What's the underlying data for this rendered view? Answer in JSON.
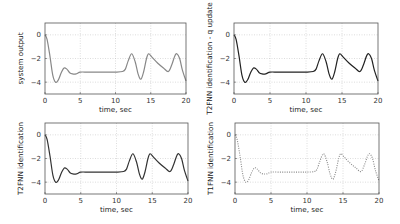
{
  "chart_data": [
    {
      "type": "line",
      "title": "",
      "xlabel": "time, sec",
      "ylabel": "system output",
      "xlim": [
        0,
        20
      ],
      "ylim": [
        -5,
        1
      ],
      "xticks": [
        0,
        5,
        10,
        15,
        20
      ],
      "yticks": [
        0,
        -2,
        -4
      ],
      "grid": true,
      "series": [
        {
          "name": "system output",
          "color": "#888888",
          "style": "solid",
          "x": [
            0,
            0.3,
            0.7,
            1.1,
            1.5,
            1.9,
            2.3,
            2.7,
            3.1,
            3.5,
            3.9,
            4.4,
            5,
            6,
            7,
            8,
            9,
            10,
            11,
            11.4,
            11.8,
            12.3,
            12.8,
            13.2,
            13.6,
            14.0,
            14.4,
            14.7,
            15.2,
            16,
            16.8,
            17.5,
            18.0,
            18.4,
            18.7,
            19.1,
            19.5,
            20
          ],
          "values": [
            0,
            -0.4,
            -1.8,
            -3.4,
            -4.0,
            -3.8,
            -3.2,
            -2.8,
            -2.9,
            -3.2,
            -3.3,
            -3.3,
            -3.15,
            -3.15,
            -3.15,
            -3.15,
            -3.15,
            -3.15,
            -3.1,
            -2.9,
            -2.2,
            -1.6,
            -2.3,
            -3.3,
            -3.75,
            -3.1,
            -2.0,
            -1.6,
            -1.9,
            -2.4,
            -2.8,
            -3.1,
            -2.5,
            -1.8,
            -1.6,
            -2.0,
            -3.0,
            -3.9
          ]
        }
      ]
    },
    {
      "type": "line",
      "title": "",
      "xlabel": "time, sec",
      "ylabel": "T2FNN identification - q update",
      "xlim": [
        0,
        20
      ],
      "ylim": [
        -5,
        1
      ],
      "xticks": [
        0,
        5,
        10,
        15,
        20
      ],
      "yticks": [
        0,
        -2,
        -4
      ],
      "grid": true,
      "series": [
        {
          "name": "T2FNN identification - q update",
          "color": "#222222",
          "style": "solid",
          "x": [
            0,
            0.3,
            0.7,
            1.1,
            1.5,
            1.9,
            2.3,
            2.7,
            3.1,
            3.5,
            3.9,
            4.4,
            5,
            6,
            7,
            8,
            9,
            10,
            11,
            11.4,
            11.8,
            12.3,
            12.8,
            13.2,
            13.6,
            14.0,
            14.4,
            14.7,
            15.2,
            16,
            16.8,
            17.5,
            18.0,
            18.4,
            18.7,
            19.1,
            19.5,
            20
          ],
          "values": [
            0,
            -0.4,
            -1.8,
            -3.4,
            -4.0,
            -3.8,
            -3.2,
            -2.8,
            -2.9,
            -3.2,
            -3.3,
            -3.3,
            -3.15,
            -3.15,
            -3.15,
            -3.15,
            -3.15,
            -3.15,
            -3.1,
            -2.9,
            -2.2,
            -1.6,
            -2.3,
            -3.3,
            -3.75,
            -3.1,
            -2.0,
            -1.6,
            -1.9,
            -2.4,
            -2.8,
            -3.1,
            -2.5,
            -1.8,
            -1.6,
            -2.0,
            -3.0,
            -3.9
          ]
        }
      ]
    },
    {
      "type": "line",
      "title": "",
      "xlabel": "time, sec",
      "ylabel": "T2FNN identification",
      "xlim": [
        0,
        20
      ],
      "ylim": [
        -5,
        1
      ],
      "xticks": [
        0,
        5,
        10,
        15,
        20
      ],
      "yticks": [
        0,
        -2,
        -4
      ],
      "grid": true,
      "series": [
        {
          "name": "T2FNN identification",
          "color": "#333333",
          "style": "solid",
          "x": [
            0,
            0.3,
            0.7,
            1.1,
            1.5,
            1.9,
            2.3,
            2.7,
            3.1,
            3.5,
            3.9,
            4.4,
            5,
            6,
            7,
            8,
            9,
            10,
            11,
            11.4,
            11.8,
            12.3,
            12.8,
            13.2,
            13.6,
            14.0,
            14.4,
            14.7,
            15.2,
            16,
            16.8,
            17.5,
            18.0,
            18.4,
            18.7,
            19.1,
            19.5,
            20
          ],
          "values": [
            0,
            -0.4,
            -1.8,
            -3.4,
            -4.0,
            -3.8,
            -3.2,
            -2.8,
            -2.9,
            -3.2,
            -3.3,
            -3.3,
            -3.15,
            -3.15,
            -3.15,
            -3.15,
            -3.15,
            -3.15,
            -3.1,
            -2.9,
            -2.2,
            -1.6,
            -2.3,
            -3.3,
            -3.75,
            -3.1,
            -2.0,
            -1.6,
            -1.9,
            -2.4,
            -2.8,
            -3.1,
            -2.5,
            -1.8,
            -1.6,
            -2.0,
            -3.0,
            -3.9
          ]
        }
      ]
    },
    {
      "type": "line",
      "title": "",
      "xlabel": "time, sec",
      "ylabel": "T1FNN identification",
      "xlim": [
        0,
        20
      ],
      "ylim": [
        -5,
        1
      ],
      "xticks": [
        0,
        5,
        10,
        15,
        20
      ],
      "yticks": [
        0,
        -2,
        -4
      ],
      "grid": true,
      "series": [
        {
          "name": "T1FNN identification",
          "color": "#888888",
          "style": "dotted",
          "x": [
            0,
            0.3,
            0.7,
            1.1,
            1.5,
            1.9,
            2.3,
            2.7,
            3.1,
            3.5,
            3.9,
            4.4,
            5,
            6,
            7,
            8,
            9,
            10,
            11,
            11.4,
            11.8,
            12.3,
            12.8,
            13.2,
            13.6,
            14.0,
            14.4,
            14.7,
            15.2,
            16,
            16.8,
            17.5,
            18.0,
            18.4,
            18.7,
            19.1,
            19.5,
            20
          ],
          "values": [
            0,
            -0.4,
            -1.8,
            -3.4,
            -4.0,
            -3.8,
            -3.2,
            -2.8,
            -2.9,
            -3.2,
            -3.3,
            -3.3,
            -3.15,
            -3.15,
            -3.15,
            -3.15,
            -3.15,
            -3.15,
            -3.1,
            -2.9,
            -2.2,
            -1.6,
            -2.3,
            -3.3,
            -3.75,
            -3.1,
            -2.0,
            -1.6,
            -1.9,
            -2.4,
            -2.8,
            -3.1,
            -2.5,
            -1.8,
            -1.6,
            -2.0,
            -3.0,
            -3.9
          ]
        }
      ]
    }
  ],
  "layout": {
    "panels": [
      {
        "left": 45,
        "top": 23,
        "width": 141,
        "height": 71
      },
      {
        "left": 234,
        "top": 23,
        "width": 144,
        "height": 71
      },
      {
        "left": 45,
        "top": 123,
        "width": 143,
        "height": 71
      },
      {
        "left": 235,
        "top": 123,
        "width": 144,
        "height": 71
      }
    ]
  }
}
